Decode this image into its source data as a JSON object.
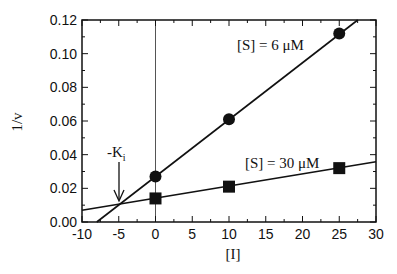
{
  "chart_data": {
    "type": "line",
    "title": "",
    "xlabel": "[I]",
    "ylabel": "1/v",
    "xlim": [
      -10,
      30
    ],
    "ylim": [
      0.0,
      0.12
    ],
    "x_ticks": [
      -10,
      -5,
      0,
      5,
      10,
      15,
      20,
      25,
      30
    ],
    "x_tick_labels": [
      "-10",
      "-5",
      "0",
      "5",
      "10",
      "15",
      "20",
      "25",
      "30"
    ],
    "y_ticks": [
      0.0,
      0.02,
      0.04,
      0.06,
      0.08,
      0.1,
      0.12
    ],
    "y_tick_labels": [
      "0.00",
      "0.02",
      "0.04",
      "0.06",
      "0.08",
      "0.10",
      "0.12"
    ],
    "grid": false,
    "legend": "none (inline labels)",
    "series": [
      {
        "name": "[S] = 6 μM",
        "marker": "circle",
        "x": [
          0,
          10,
          25
        ],
        "y": [
          0.027,
          0.061,
          0.112
        ],
        "fit_line": {
          "slope": 0.00338,
          "intercept": 0.027
        }
      },
      {
        "name": "[S] = 30 μM",
        "marker": "square",
        "x": [
          0,
          10,
          25
        ],
        "y": [
          0.014,
          0.021,
          0.032
        ],
        "fit_line": {
          "slope": 0.00072,
          "intercept": 0.0142
        }
      }
    ],
    "annotations": [
      {
        "text": "-K",
        "subscript": "i",
        "arrow_to": [
          -5,
          0.01
        ]
      },
      {
        "text": "[S] = 6 μM",
        "near": [
          12,
          0.106
        ]
      },
      {
        "text": "[S] = 30 μM",
        "near": [
          12,
          0.03
        ]
      }
    ],
    "vertical_reference_line": {
      "x": 0
    }
  },
  "labels": {
    "ylabel": "1/v",
    "xlabel": "[I]",
    "series1": "[S] = 6 μM",
    "series2": "[S] = 30 μM",
    "ki_main": "-K",
    "ki_sub": "i"
  }
}
